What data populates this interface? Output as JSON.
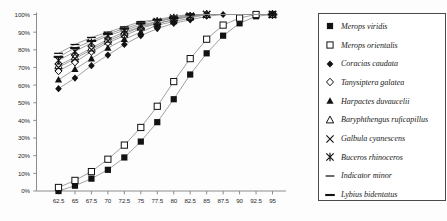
{
  "chart_data": {
    "type": "line",
    "title": "",
    "xlabel": "",
    "ylabel": "",
    "xlim": [
      62.5,
      95
    ],
    "ylim": [
      0,
      1
    ],
    "grid": false,
    "legend_position": "right",
    "x": [
      62.5,
      65,
      67.5,
      70,
      72.5,
      75,
      77.5,
      80,
      82.5,
      85,
      87.5,
      90,
      92.5,
      95
    ],
    "xtick_labels": [
      "62.5",
      "65",
      "67.5",
      "70",
      "72.5",
      "75",
      "77.5",
      "80",
      "82.5",
      "85",
      "87.5",
      "90",
      "92.5",
      "95"
    ],
    "ytick_labels": [
      "0%",
      "10%",
      "20%",
      "30%",
      "40%",
      "50%",
      "60%",
      "70%",
      "80%",
      "90%",
      "100%"
    ],
    "ytick_values": [
      0,
      10,
      20,
      30,
      40,
      50,
      60,
      70,
      80,
      90,
      100
    ],
    "series": [
      {
        "name": "Merops viridis",
        "marker": "filled-square",
        "values": [
          0,
          3,
          7,
          12,
          19,
          28,
          39,
          52,
          66,
          78,
          88,
          95,
          99,
          100
        ]
      },
      {
        "name": "Merops orientalis",
        "marker": "open-square",
        "values": [
          2,
          6,
          11,
          18,
          26,
          36,
          48,
          62,
          75,
          86,
          94,
          98,
          100,
          100
        ]
      },
      {
        "name": "Coracias caudata",
        "marker": "filled-diamond",
        "values": [
          58,
          64,
          71,
          77,
          83,
          88,
          92,
          95,
          97,
          99,
          100,
          100,
          100,
          100
        ]
      },
      {
        "name": "Tanysiptera galatea",
        "marker": "open-diamond",
        "values": [
          68,
          73,
          79,
          84,
          88,
          92,
          95,
          97,
          99,
          100,
          100,
          100,
          100,
          100
        ]
      },
      {
        "name": "Harpactes duvaucelii",
        "marker": "filled-triangle",
        "values": [
          63,
          69,
          75,
          81,
          86,
          90,
          94,
          96,
          98,
          100,
          100,
          100,
          100,
          100
        ]
      },
      {
        "name": "Baryphthengus ruficapillus",
        "marker": "open-triangle",
        "values": [
          71,
          76,
          81,
          86,
          90,
          93,
          96,
          98,
          99,
          100,
          100,
          100,
          100,
          100
        ]
      },
      {
        "name": "Galbula cyanescens",
        "marker": "cross-x",
        "values": [
          70,
          75,
          80,
          85,
          89,
          93,
          95,
          97,
          99,
          100,
          100,
          100,
          100,
          100
        ]
      },
      {
        "name": "Buceros rhinoceros",
        "marker": "star-x",
        "values": [
          74,
          79,
          84,
          88,
          91,
          94,
          96,
          98,
          99,
          100,
          100,
          100,
          100,
          100
        ]
      },
      {
        "name": "Indicator minor",
        "marker": "thin-dash",
        "values": [
          78,
          83,
          87,
          90,
          93,
          96,
          97,
          99,
          100,
          100,
          100,
          100,
          100,
          100
        ]
      },
      {
        "name": "Lybius bidentatus",
        "marker": "thick-dash",
        "values": [
          76,
          81,
          85,
          89,
          92,
          95,
          97,
          98,
          100,
          100,
          100,
          100,
          100,
          100
        ]
      }
    ]
  },
  "colors": {
    "axis": "#8c8c8c",
    "line": "#8f8f8f",
    "marker": "#121212",
    "text": "#1b1b1b",
    "legend_border": "#4a4a4a"
  }
}
